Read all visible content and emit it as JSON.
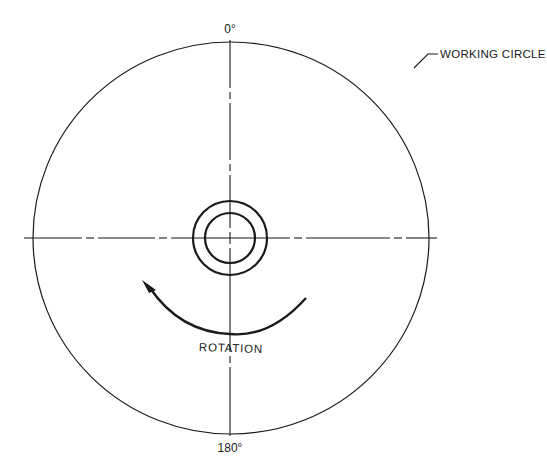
{
  "diagram": {
    "labels": {
      "top_angle": "0°",
      "bottom_angle": "180°",
      "working_circle": "WORKING CIRCLE",
      "rotation": "ROTATION"
    },
    "colors": {
      "line": "#1a1a1a",
      "background": "#ffffff"
    },
    "geometry": {
      "center": [
        230,
        238
      ],
      "working_circle_radii": [
        198,
        196
      ],
      "hub_outer_radius": 37,
      "hub_inner_radius": 25,
      "rotation_arc": "counter-clockwise arrow"
    }
  }
}
